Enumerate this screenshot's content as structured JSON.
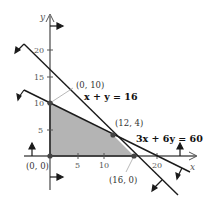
{
  "figure": {
    "axes": {
      "x_label": "x",
      "y_label": "y",
      "x_ticks": [
        "5",
        "10",
        "20"
      ],
      "y_ticks": [
        "5",
        "10",
        "15",
        "20"
      ]
    },
    "lines": [
      {
        "id": "line1",
        "equation": "x + y = 16"
      },
      {
        "id": "line2",
        "equation": "3x + 6y = 60"
      }
    ],
    "points": [
      {
        "label": "(0, 0)",
        "x": 0,
        "y": 0
      },
      {
        "label": "(0, 10)",
        "x": 0,
        "y": 10
      },
      {
        "label": "(12, 4)",
        "x": 12,
        "y": 4
      },
      {
        "label": "(16, 0)",
        "x": 16,
        "y": 0
      }
    ],
    "feasible_region": {
      "vertices": [
        [
          0,
          0
        ],
        [
          0,
          10
        ],
        [
          12,
          4
        ],
        [
          16,
          0
        ]
      ],
      "fill": "#b4b4b4"
    },
    "colors": {
      "line": "#1a1a1a",
      "axis": "#555555",
      "region": "#b4b4b4"
    }
  }
}
